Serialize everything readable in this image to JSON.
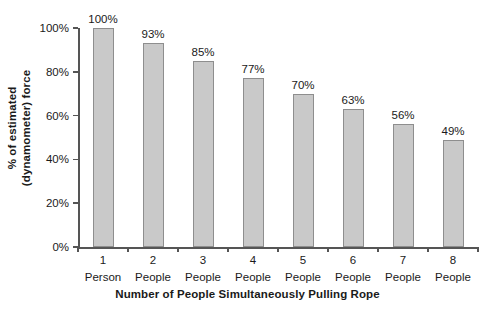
{
  "chart_data": {
    "type": "bar",
    "title": "",
    "subtitle": "",
    "xlabel": "Number of People Simultaneously Pulling Rope",
    "ylabel": "% of estimated (dynamometer) force",
    "ylabel_lines": [
      "% of estimated",
      "(dynamometer) force"
    ],
    "categories": [
      "1 Person",
      "2 People",
      "3 People",
      "4 People",
      "5 People",
      "6 People",
      "7 People",
      "8 People"
    ],
    "category_parts": [
      {
        "num": "1",
        "unit": "Person"
      },
      {
        "num": "2",
        "unit": "People"
      },
      {
        "num": "3",
        "unit": "People"
      },
      {
        "num": "4",
        "unit": "People"
      },
      {
        "num": "5",
        "unit": "People"
      },
      {
        "num": "6",
        "unit": "People"
      },
      {
        "num": "7",
        "unit": "People"
      },
      {
        "num": "8",
        "unit": "People"
      }
    ],
    "values": [
      100,
      93,
      85,
      77,
      70,
      63,
      56,
      49
    ],
    "data_labels": [
      "100%",
      "93%",
      "85%",
      "77%",
      "70%",
      "63%",
      "56%",
      "49%"
    ],
    "ylim": [
      0,
      100
    ],
    "ytick_values": [
      0,
      20,
      40,
      60,
      80,
      100
    ],
    "ytick_labels": [
      "0%",
      "20%",
      "40%",
      "60%",
      "80%",
      "100%"
    ],
    "grid": false,
    "legend": false,
    "legend_position": "none",
    "bar_fill_color": "#c9c9c9",
    "bar_border_color": "#8e8e8e",
    "axis_color": "#555555",
    "text_color": "#1a1a1a",
    "background_color": "#ffffff"
  }
}
